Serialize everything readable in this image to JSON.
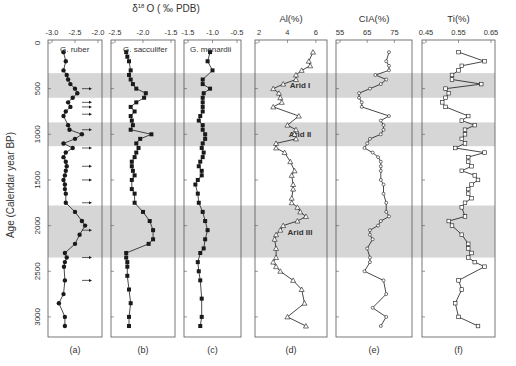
{
  "chart_data": {
    "type": "line",
    "ylabel": "Age (Calendar year BP)",
    "ylim": [
      0,
      3150
    ],
    "yticks": [
      0,
      500,
      1000,
      1500,
      2000,
      2500,
      3000
    ],
    "shared_title_abc": "δ18O (‰PDB)",
    "arid_bands": [
      {
        "label": "Arid I",
        "from": 330,
        "to": 600
      },
      {
        "label": "Arid II",
        "from": 870,
        "to": 1130
      },
      {
        "label": "Arid III",
        "from": 1780,
        "to": 2350
      }
    ],
    "panels": [
      {
        "id": "a",
        "label": "(a)",
        "inset_label": "G. ruber",
        "xlabel": "",
        "xlim": [
          -3.0,
          -2.0
        ],
        "xticks": [
          "-3.0",
          "-2.5",
          "-2.0"
        ],
        "marker": "circle-filled",
        "ages": [
          100,
          200,
          300,
          350,
          400,
          450,
          500,
          550,
          600,
          650,
          700,
          750,
          800,
          900,
          950,
          1000,
          1050,
          1100,
          1150,
          1200,
          1250,
          1300,
          1350,
          1400,
          1450,
          1500,
          1550,
          1600,
          1650,
          1750,
          1850,
          1950,
          2000,
          2100,
          2200,
          2300,
          2350,
          2400,
          2450,
          2600,
          2750,
          2850,
          3000,
          3100
        ],
        "values": [
          -2.75,
          -2.7,
          -2.75,
          -2.68,
          -2.65,
          -2.6,
          -2.5,
          -2.45,
          -2.55,
          -2.65,
          -2.6,
          -2.7,
          -2.75,
          -2.65,
          -2.62,
          -2.35,
          -2.5,
          -2.75,
          -2.55,
          -2.7,
          -2.75,
          -2.7,
          -2.68,
          -2.7,
          -2.72,
          -2.75,
          -2.72,
          -2.72,
          -2.7,
          -2.7,
          -2.5,
          -2.35,
          -2.28,
          -2.4,
          -2.5,
          -2.72,
          -2.68,
          -2.72,
          -2.74,
          -2.72,
          -2.75,
          -2.85,
          -2.72,
          -2.72
        ],
        "arrows_at_ages": [
          500,
          650,
          700,
          780,
          950,
          1150,
          1350,
          1500,
          1750,
          2050,
          2350,
          2600
        ]
      },
      {
        "id": "b",
        "label": "(b)",
        "inset_label": "G. sacculifer",
        "xlabel": "",
        "xlim": [
          -2.5,
          -1.5
        ],
        "xticks": [
          "-2.5",
          "-2.0",
          "-1.5"
        ],
        "marker": "square-filled",
        "ages": [
          100,
          150,
          200,
          300,
          350,
          400,
          450,
          500,
          550,
          600,
          650,
          700,
          750,
          800,
          850,
          900,
          950,
          1000,
          1050,
          1100,
          1150,
          1200,
          1250,
          1300,
          1350,
          1400,
          1450,
          1500,
          1600,
          1650,
          1750,
          1850,
          1950,
          2050,
          2150,
          2200,
          2300,
          2350,
          2400,
          2450,
          2550,
          2700,
          2850,
          3000,
          3100
        ],
        "values": [
          -2.3,
          -2.28,
          -2.25,
          -2.22,
          -2.25,
          -2.22,
          -2.18,
          -2.12,
          -1.95,
          -1.98,
          -2.12,
          -2.22,
          -2.15,
          -2.22,
          -2.2,
          -2.18,
          -2.22,
          -1.85,
          -2.05,
          -2.12,
          -2.08,
          -2.12,
          -2.15,
          -2.2,
          -2.2,
          -2.18,
          -2.15,
          -2.2,
          -2.2,
          -2.15,
          -2.15,
          -2.0,
          -1.88,
          -1.82,
          -1.82,
          -1.9,
          -2.3,
          -2.3,
          -2.28,
          -2.28,
          -2.28,
          -2.25,
          -2.22,
          -2.25,
          -2.25
        ],
        "arrows_at_ages": []
      },
      {
        "id": "c",
        "label": "(c)",
        "inset_label": "G. menardii",
        "xlabel": "",
        "xlim": [
          -1.5,
          -0.5
        ],
        "xticks": [
          "-1.5",
          "-1.0",
          "-0.5"
        ],
        "marker": "square-filled",
        "ages": [
          100,
          200,
          300,
          400,
          450,
          500,
          550,
          600,
          650,
          700,
          750,
          800,
          850,
          900,
          950,
          1000,
          1050,
          1100,
          1150,
          1200,
          1250,
          1300,
          1350,
          1400,
          1450,
          1500,
          1550,
          1650,
          1750,
          1850,
          1950,
          2050,
          2150,
          2250,
          2300,
          2400,
          2500,
          2600,
          2800,
          3000,
          3100
        ],
        "values": [
          -1.05,
          -1.1,
          -1.0,
          -1.2,
          -1.2,
          -1.05,
          -1.18,
          -1.2,
          -1.2,
          -1.2,
          -1.2,
          -1.25,
          -1.28,
          -1.2,
          -1.2,
          -1.15,
          -1.15,
          -1.2,
          -1.22,
          -1.18,
          -1.2,
          -1.25,
          -1.28,
          -1.22,
          -1.22,
          -1.3,
          -1.35,
          -1.3,
          -1.28,
          -1.2,
          -1.15,
          -1.1,
          -1.15,
          -1.18,
          -1.25,
          -1.3,
          -1.28,
          -1.25,
          -1.22,
          -1.22,
          -1.25
        ],
        "arrows_at_ages": []
      },
      {
        "id": "d",
        "label": "(d)",
        "xlabel": "Al(%)",
        "xlim": [
          2,
          6.5
        ],
        "xticks": [
          "2",
          "4",
          "6"
        ],
        "marker": "triangle-open",
        "ages": [
          100,
          200,
          250,
          300,
          350,
          400,
          450,
          500,
          550,
          600,
          650,
          700,
          800,
          900,
          950,
          1000,
          1050,
          1100,
          1150,
          1200,
          1300,
          1400,
          1450,
          1550,
          1600,
          1700,
          1750,
          1800,
          1850,
          1900,
          1950,
          2000,
          2050,
          2100,
          2150,
          2250,
          2350,
          2400,
          2450,
          2500,
          2600,
          2700,
          2850,
          3000,
          3100
        ],
        "values": [
          5.8,
          5.5,
          5.6,
          5.0,
          4.6,
          4.6,
          3.7,
          3.0,
          3.4,
          3.5,
          3.6,
          3.0,
          4.8,
          4.0,
          4.6,
          4.5,
          4.6,
          3.2,
          3.2,
          3.8,
          4.2,
          4.5,
          4.3,
          4.4,
          4.4,
          4.3,
          4.3,
          4.7,
          4.9,
          5.3,
          4.7,
          3.7,
          3.5,
          3.2,
          3.1,
          3.2,
          3.2,
          3.0,
          3.2,
          3.5,
          4.4,
          5.0,
          5.2,
          4.0,
          5.3
        ],
        "arrows_at_ages": []
      },
      {
        "id": "e",
        "label": "(e)",
        "xlabel": "CIA(%)",
        "xlim": [
          55,
          80
        ],
        "xticks": [
          "55",
          "65",
          "75"
        ],
        "marker": "circle-open",
        "ages": [
          100,
          200,
          250,
          300,
          350,
          400,
          450,
          500,
          550,
          600,
          650,
          700,
          800,
          850,
          900,
          950,
          1000,
          1050,
          1100,
          1150,
          1200,
          1250,
          1300,
          1350,
          1400,
          1500,
          1550,
          1650,
          1750,
          1850,
          1900,
          1950,
          2000,
          2050,
          2100,
          2150,
          2250,
          2350,
          2400,
          2500,
          2600,
          2750,
          2900,
          3000,
          3100
        ],
        "values": [
          73,
          72,
          73,
          73,
          68,
          72,
          70,
          66,
          62,
          62,
          63,
          63,
          73,
          70,
          71,
          71,
          70,
          66,
          65,
          64,
          67,
          69,
          70,
          70,
          70,
          70,
          71,
          71,
          72,
          72,
          73,
          70,
          69,
          66,
          66,
          67,
          65,
          66,
          66,
          64,
          71,
          72,
          67,
          72,
          70
        ],
        "arrows_at_ages": []
      },
      {
        "id": "f",
        "label": "(f)",
        "xlabel": "Ti(%)",
        "xlim": [
          0.45,
          0.65
        ],
        "xticks": [
          "0.45",
          "0.55",
          "0.65"
        ],
        "marker": "square-open",
        "ages": [
          100,
          200,
          250,
          300,
          350,
          400,
          450,
          500,
          550,
          600,
          650,
          700,
          800,
          850,
          900,
          950,
          1000,
          1050,
          1100,
          1150,
          1200,
          1250,
          1300,
          1350,
          1400,
          1450,
          1500,
          1550,
          1600,
          1650,
          1700,
          1750,
          1800,
          1900,
          1950,
          2000,
          2100,
          2200,
          2250,
          2300,
          2350,
          2400,
          2450,
          2600,
          2700,
          2850,
          3000,
          3100
        ],
        "values": [
          0.55,
          0.63,
          0.56,
          0.55,
          0.53,
          0.53,
          0.62,
          0.51,
          0.52,
          0.51,
          0.5,
          0.51,
          0.58,
          0.56,
          0.6,
          0.57,
          0.57,
          0.56,
          0.57,
          0.54,
          0.63,
          0.58,
          0.58,
          0.59,
          0.56,
          0.6,
          0.61,
          0.59,
          0.58,
          0.58,
          0.59,
          0.57,
          0.56,
          0.57,
          0.52,
          0.53,
          0.56,
          0.58,
          0.58,
          0.59,
          0.58,
          0.6,
          0.63,
          0.55,
          0.56,
          0.54,
          0.55,
          0.61
        ],
        "arrows_at_ages": []
      }
    ]
  },
  "labels": {
    "d18o_title_prefix": "δ",
    "d18o_sup": "18",
    "d18o_title_suffix": "O ( ‰ PDB)",
    "ylabel": "Age (Calendar year BP)",
    "arid1": "Arid I",
    "arid2": "Arid II",
    "arid3": "Arid III"
  },
  "colors": {
    "band": "#d6d6d6",
    "line": "#1a1a1a",
    "axis": "#555555"
  }
}
